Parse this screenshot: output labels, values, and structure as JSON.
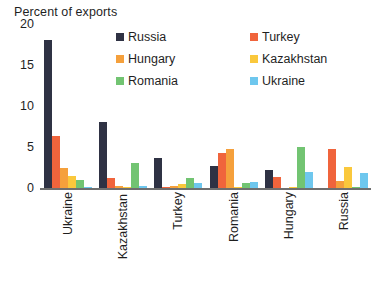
{
  "chart_data": {
    "type": "bar",
    "title": "",
    "ylabel": "Percent of exports",
    "xlabel": "",
    "ylim": [
      0,
      20
    ],
    "yticks": [
      0,
      5,
      10,
      15,
      20
    ],
    "ytick_labels": [
      "0",
      "5",
      "10",
      "15",
      "20"
    ],
    "grid": false,
    "legend_position": "top-right",
    "categories": [
      "Ukraine",
      "Kazakhstan",
      "Turkey",
      "Romania",
      "Hungary",
      "Russia"
    ],
    "category_labels_note": "Kazakhstan label is clipped at bottom of image",
    "series": [
      {
        "name": "Russia",
        "color": "#2f3244",
        "values": [
          18.0,
          8.0,
          3.6,
          2.7,
          2.2,
          0.0
        ]
      },
      {
        "name": "Turkey",
        "color": "#f0643c",
        "values": [
          6.3,
          1.2,
          0.1,
          4.3,
          1.3,
          4.8
        ]
      },
      {
        "name": "Hungary",
        "color": "#f5a03c",
        "values": [
          2.5,
          0.2,
          0.3,
          4.7,
          0.0,
          0.8
        ]
      },
      {
        "name": "Kazakhstan",
        "color": "#fac83c",
        "values": [
          1.5,
          0.1,
          0.5,
          0.1,
          0.1,
          2.6
        ]
      },
      {
        "name": "Romania",
        "color": "#72c472",
        "values": [
          1.0,
          3.0,
          1.2,
          0.6,
          5.0,
          0.1
        ]
      },
      {
        "name": "Ukraine",
        "color": "#6ec7ee",
        "values": [
          0.1,
          0.3,
          0.6,
          0.7,
          1.9,
          1.8
        ]
      }
    ]
  },
  "axis": {
    "title": "Percent of exports"
  },
  "legend": {
    "left_column": [
      {
        "label": "Russia"
      },
      {
        "label": "Hungary"
      },
      {
        "label": "Romania"
      }
    ],
    "right_column": [
      {
        "label": "Turkey"
      },
      {
        "label": "Kazakhstan"
      },
      {
        "label": "Ukraine"
      }
    ]
  }
}
